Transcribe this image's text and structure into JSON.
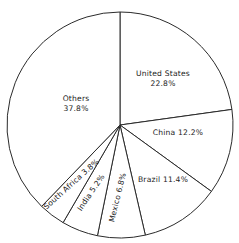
{
  "chart_data": {
    "type": "pie",
    "title": "",
    "subtitle": "",
    "xlabel": "",
    "ylabel": "",
    "legend_position": "none",
    "grid": false,
    "start_angle_deg": 90,
    "direction": "clockwise",
    "value_unit": "%",
    "categories": [
      "United States",
      "China",
      "Brazil",
      "Mexico",
      "India",
      "South Africa",
      "Others"
    ],
    "values": [
      22.8,
      12.2,
      11.4,
      6.8,
      5.2,
      3.8,
      37.8
    ],
    "slices": [
      {
        "name": "United States",
        "value": 22.8,
        "label_line1": "United States",
        "label_line2": "22.8%",
        "label_style": "two-line",
        "label_rotation": 0,
        "label_x": 163,
        "label_y": 76,
        "label_x2": 163,
        "label_y2": 86,
        "color": "#ffffff"
      },
      {
        "name": "China",
        "value": 12.2,
        "label_line1": "China  12.2%",
        "label_line2": "",
        "label_style": "inline",
        "label_rotation": 0,
        "label_x": 178,
        "label_y": 135,
        "label_x2": 0,
        "label_y2": 0,
        "color": "#ffffff"
      },
      {
        "name": "Brazil",
        "value": 11.4,
        "label_line1": "Brazil  11.4%",
        "label_line2": "",
        "label_style": "inline",
        "label_rotation": 0,
        "label_x": 163,
        "label_y": 182,
        "label_x2": 0,
        "label_y2": 0,
        "color": "#ffffff"
      },
      {
        "name": "Mexico",
        "value": 6.8,
        "label_line1": "Mexico  6.8%",
        "label_line2": "",
        "label_style": "radial",
        "label_rotation": -76,
        "label_x": 120,
        "label_y": 198,
        "label_x2": 0,
        "label_y2": 0,
        "color": "#ffffff"
      },
      {
        "name": "India",
        "value": 5.2,
        "label_line1": "India  5.2%",
        "label_line2": "",
        "label_style": "radial",
        "label_rotation": -56,
        "label_x": 93,
        "label_y": 194,
        "label_x2": 0,
        "label_y2": 0,
        "color": "#ffffff"
      },
      {
        "name": "South Africa",
        "value": 3.8,
        "label_line1": "South Africa  3.8%",
        "label_line2": "",
        "label_style": "radial",
        "label_rotation": -42,
        "label_x": 73,
        "label_y": 186,
        "label_x2": 0,
        "label_y2": 0,
        "color": "#ffffff"
      },
      {
        "name": "Others",
        "value": 37.8,
        "label_line1": "Others",
        "label_line2": "37.8%",
        "label_style": "two-line",
        "label_rotation": 0,
        "label_x": 76,
        "label_y": 101,
        "label_x2": 76,
        "label_y2": 111,
        "color": "#ffffff"
      }
    ],
    "geometry": {
      "center_x": 120,
      "center_y": 125,
      "radius": 113
    },
    "style": {
      "background": "#ffffff",
      "slice_fill": "#ffffff",
      "outline_color": "#2b2b2b",
      "text_color": "#1a1a1a"
    }
  }
}
